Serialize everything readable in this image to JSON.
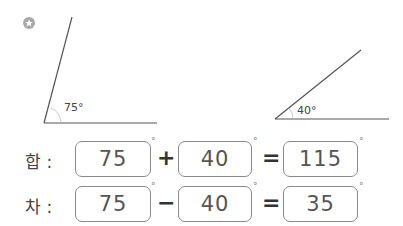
{
  "icon": {
    "name": "star-icon"
  },
  "angles": [
    {
      "label": "75°"
    },
    {
      "label": "40°"
    }
  ],
  "rows": [
    {
      "label": "합 :",
      "a": "75",
      "op": "+",
      "b": "40",
      "eq": "=",
      "result": "115",
      "deg": "°"
    },
    {
      "label": "차 :",
      "a": "75",
      "op": "−",
      "b": "40",
      "eq": "=",
      "result": "35",
      "deg": "°"
    }
  ]
}
